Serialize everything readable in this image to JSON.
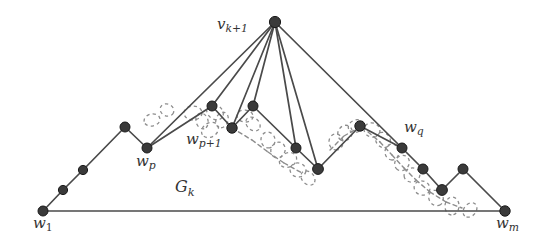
{
  "figure": {
    "caption_labels": {
      "apex": "v",
      "apex_sub": "k+1",
      "graph": "G",
      "graph_sub": "k"
    },
    "colors": {
      "node_fill": "#3a3a3a",
      "node_stroke": "#1a1a1a",
      "solid_edge": "#4a4a4a",
      "dashed_edge": "#8c8c8c",
      "background": "#ffffff",
      "label_text": "#333333"
    },
    "labels": [
      {
        "id": "label-vk1",
        "base": "v",
        "sub": "k+1",
        "sub_style": "mixed",
        "x": 217,
        "y": 17
      },
      {
        "id": "label-wp",
        "base": "w",
        "sub": "p",
        "sub_style": "italic",
        "x": 136,
        "y": 154
      },
      {
        "id": "label-wp1",
        "base": "w",
        "sub": "p+1",
        "sub_style": "mixed",
        "x": 186,
        "y": 132
      },
      {
        "id": "label-wq",
        "base": "w",
        "sub": "q",
        "sub_style": "italic",
        "x": 404,
        "y": 120
      },
      {
        "id": "label-w1",
        "base": "w",
        "sub": "1",
        "sub_style": "upright",
        "x": 33,
        "y": 216
      },
      {
        "id": "label-wm",
        "base": "w",
        "sub": "m",
        "sub_style": "italic",
        "x": 496,
        "y": 216
      },
      {
        "id": "label-gk",
        "base": "G",
        "sub": "k",
        "sub_style": "italic",
        "x": 175,
        "y": 179
      }
    ],
    "nodes": [
      {
        "name": "w1",
        "x": 43,
        "y": 211,
        "r": 5.0
      },
      {
        "name": "n2",
        "x": 63,
        "y": 190,
        "r": 4.6
      },
      {
        "name": "n3",
        "x": 83,
        "y": 170,
        "r": 4.6
      },
      {
        "name": "n4",
        "x": 125,
        "y": 127,
        "r": 5.0
      },
      {
        "name": "wp",
        "x": 147,
        "y": 148,
        "r": 5.0
      },
      {
        "name": "a1",
        "x": 212,
        "y": 106,
        "r": 5.0
      },
      {
        "name": "wp1",
        "x": 232,
        "y": 128,
        "r": 5.2
      },
      {
        "name": "a2",
        "x": 253,
        "y": 106,
        "r": 5.0
      },
      {
        "name": "apex",
        "x": 275,
        "y": 22,
        "r": 5.6
      },
      {
        "name": "a3",
        "x": 296,
        "y": 148,
        "r": 5.0
      },
      {
        "name": "a4",
        "x": 318,
        "y": 169,
        "r": 5.4
      },
      {
        "name": "a5",
        "x": 360,
        "y": 126,
        "r": 5.2
      },
      {
        "name": "wq",
        "x": 402,
        "y": 148,
        "r": 5.0
      },
      {
        "name": "r1",
        "x": 423,
        "y": 169,
        "r": 5.0
      },
      {
        "name": "r2",
        "x": 442,
        "y": 190,
        "r": 5.4
      },
      {
        "name": "r3",
        "x": 463,
        "y": 169,
        "r": 5.0
      },
      {
        "name": "wm",
        "x": 505,
        "y": 211,
        "r": 5.2
      }
    ],
    "solid_edges": [
      [
        "w1",
        "n2"
      ],
      [
        "n2",
        "n3"
      ],
      [
        "n3",
        "n4"
      ],
      [
        "n4",
        "wp"
      ],
      [
        "wp",
        "a1"
      ],
      [
        "a1",
        "wp1"
      ],
      [
        "wp1",
        "a2"
      ],
      [
        "a2",
        "a3"
      ],
      [
        "a3",
        "a4"
      ],
      [
        "a4",
        "a5"
      ],
      [
        "a5",
        "wq"
      ],
      [
        "wq",
        "r1"
      ],
      [
        "r1",
        "r2"
      ],
      [
        "r2",
        "r3"
      ],
      [
        "r3",
        "wm"
      ],
      [
        "w1",
        "wm"
      ]
    ],
    "apex_edges": [
      [
        "apex",
        "wp"
      ],
      [
        "apex",
        "a1"
      ],
      [
        "apex",
        "wp1"
      ],
      [
        "apex",
        "a2"
      ],
      [
        "apex",
        "a3"
      ],
      [
        "apex",
        "a4"
      ],
      [
        "apex",
        "wq"
      ]
    ],
    "dashed_path_points": [
      [
        150,
        140
      ],
      [
        163,
        133
      ],
      [
        178,
        126
      ],
      [
        196,
        119
      ],
      [
        212,
        126
      ],
      [
        226,
        140
      ],
      [
        240,
        152
      ],
      [
        256,
        162
      ],
      [
        272,
        172
      ],
      [
        288,
        180
      ],
      [
        302,
        186
      ],
      [
        318,
        188
      ],
      [
        334,
        180
      ],
      [
        350,
        168
      ],
      [
        362,
        152
      ],
      [
        374,
        140
      ],
      [
        388,
        135
      ],
      [
        400,
        142
      ],
      [
        410,
        156
      ],
      [
        420,
        170
      ],
      [
        430,
        182
      ],
      [
        442,
        192
      ],
      [
        456,
        200
      ],
      [
        472,
        206
      ],
      [
        490,
        210
      ]
    ],
    "dashed_blobs": [
      {
        "cx": 193,
        "cy": 113,
        "rx": 9,
        "ry": 7
      },
      {
        "cx": 215,
        "cy": 112,
        "rx": 9,
        "ry": 7
      },
      {
        "cx": 202,
        "cy": 121,
        "rx": 8,
        "ry": 6
      },
      {
        "cx": 222,
        "cy": 120,
        "rx": 8,
        "ry": 6
      },
      {
        "cx": 210,
        "cy": 130,
        "rx": 9,
        "ry": 7
      },
      {
        "cx": 245,
        "cy": 116,
        "rx": 8,
        "ry": 6
      },
      {
        "cx": 253,
        "cy": 124,
        "rx": 8,
        "ry": 6
      },
      {
        "cx": 268,
        "cy": 140,
        "rx": 8,
        "ry": 7
      },
      {
        "cx": 278,
        "cy": 150,
        "rx": 8,
        "ry": 7
      },
      {
        "cx": 288,
        "cy": 160,
        "rx": 9,
        "ry": 7
      },
      {
        "cx": 298,
        "cy": 170,
        "rx": 8,
        "ry": 7
      },
      {
        "cx": 308,
        "cy": 178,
        "rx": 8,
        "ry": 6
      },
      {
        "cx": 336,
        "cy": 142,
        "rx": 8,
        "ry": 7
      },
      {
        "cx": 345,
        "cy": 133,
        "rx": 8,
        "ry": 7
      },
      {
        "cx": 356,
        "cy": 126,
        "rx": 8,
        "ry": 6
      },
      {
        "cx": 372,
        "cy": 130,
        "rx": 8,
        "ry": 7
      },
      {
        "cx": 383,
        "cy": 140,
        "rx": 8,
        "ry": 7
      },
      {
        "cx": 392,
        "cy": 152,
        "rx": 8,
        "ry": 7
      },
      {
        "cx": 402,
        "cy": 163,
        "rx": 8,
        "ry": 7
      },
      {
        "cx": 412,
        "cy": 175,
        "rx": 8,
        "ry": 7
      },
      {
        "cx": 422,
        "cy": 188,
        "rx": 8,
        "ry": 7
      },
      {
        "cx": 436,
        "cy": 198,
        "rx": 8,
        "ry": 7
      },
      {
        "cx": 452,
        "cy": 206,
        "rx": 9,
        "ry": 7
      },
      {
        "cx": 470,
        "cy": 210,
        "rx": 8,
        "ry": 6
      },
      {
        "cx": 152,
        "cy": 120,
        "rx": 8,
        "ry": 6
      },
      {
        "cx": 167,
        "cy": 110,
        "rx": 7,
        "ry": 6
      }
    ],
    "dashed_segments": [
      [
        [
          232,
          128
        ],
        [
          252,
          140
        ]
      ],
      [
        [
          252,
          140
        ],
        [
          268,
          152
        ]
      ],
      [
        [
          268,
          152
        ],
        [
          284,
          163
        ]
      ],
      [
        [
          284,
          163
        ],
        [
          302,
          173
        ]
      ],
      [
        [
          330,
          150
        ],
        [
          344,
          136
        ]
      ],
      [
        [
          344,
          136
        ],
        [
          358,
          128
        ]
      ],
      [
        [
          368,
          132
        ],
        [
          380,
          142
        ]
      ],
      [
        [
          380,
          142
        ],
        [
          392,
          155
        ]
      ],
      [
        [
          392,
          155
        ],
        [
          404,
          168
        ]
      ],
      [
        [
          404,
          168
        ],
        [
          416,
          180
        ]
      ],
      [
        [
          416,
          180
        ],
        [
          430,
          192
        ]
      ],
      [
        [
          430,
          192
        ],
        [
          446,
          202
        ]
      ],
      [
        [
          446,
          202
        ],
        [
          462,
          208
        ]
      ]
    ]
  }
}
